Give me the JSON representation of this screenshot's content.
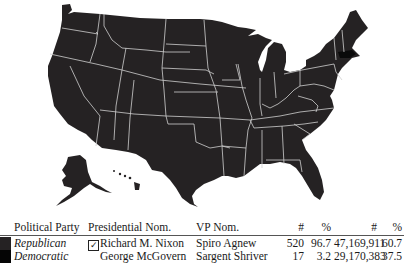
{
  "map": {
    "title": "US Presidential Election Map",
    "colors": {
      "republican": "#252223",
      "democratic": "#0a0a0a",
      "border": "#cfcfcf",
      "background": "#ffffff"
    },
    "highlighted_states": [
      {
        "state": "Massachusetts",
        "party": "Democratic"
      }
    ]
  },
  "legend": {
    "headers": {
      "party": "Political Party",
      "presidential": "Presidential Nom.",
      "vp": "VP Nom.",
      "electoral_count": "#",
      "electoral_pct": "%",
      "popular_count": "#",
      "popular_pct": "%"
    },
    "rows": [
      {
        "party": "Republican",
        "color": "#252223",
        "winner_icon": "☑",
        "presidential": "Richard M. Nixon",
        "vp": "Spiro Agnew",
        "electoral_count": "520",
        "electoral_pct": "96.7",
        "popular_count": "47,169,911",
        "popular_pct": "60.7"
      },
      {
        "party": "Democratic",
        "color": "#050505",
        "winner_icon": "",
        "presidential": "George McGovern",
        "vp": "Sargent Shriver",
        "electoral_count": "17",
        "electoral_pct": "3.2",
        "popular_count": "29,170,383",
        "popular_pct": "37.5"
      }
    ]
  }
}
